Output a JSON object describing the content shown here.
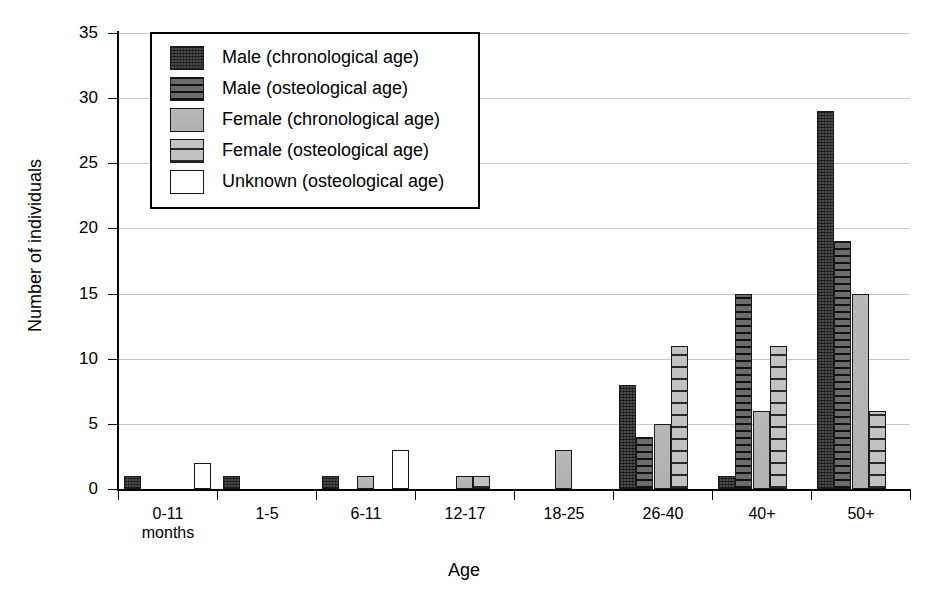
{
  "chart_data": {
    "type": "bar",
    "title": "",
    "xlabel": "Age",
    "ylabel": "Number of individuals",
    "ylim": [
      0,
      35
    ],
    "ytick_step": 5,
    "yticks": [
      0,
      5,
      10,
      15,
      20,
      25,
      30,
      35
    ],
    "grid": "horizontal",
    "legend_position": "upper-left-inside",
    "categories": [
      "0-11\nmonths",
      "1-5",
      "6-11",
      "12-17",
      "18-25",
      "26-40",
      "40+",
      "50+"
    ],
    "category_labels": [
      {
        "line1": "0-11",
        "line2": "months"
      },
      {
        "line1": "1-5",
        "line2": ""
      },
      {
        "line1": "6-11",
        "line2": ""
      },
      {
        "line1": "12-17",
        "line2": ""
      },
      {
        "line1": "18-25",
        "line2": ""
      },
      {
        "line1": "26-40",
        "line2": ""
      },
      {
        "line1": "40+",
        "line2": ""
      },
      {
        "line1": "50+",
        "line2": ""
      }
    ],
    "series": [
      {
        "name": "Male (chronological age)",
        "key": "male-chron",
        "pattern": "dark-crosshatch",
        "color": "#4a4a4a",
        "values": [
          1,
          1,
          1,
          0,
          0,
          8,
          1,
          29
        ]
      },
      {
        "name": "Male (osteological age)",
        "key": "male-osteo",
        "pattern": "dark-horizontal-lines",
        "color": "#3d3d3d",
        "values": [
          0,
          0,
          0,
          0,
          0,
          4,
          15,
          19
        ]
      },
      {
        "name": "Female (chronological age)",
        "key": "female-chron",
        "pattern": "solid-gray",
        "color": "#b3b3b3",
        "values": [
          0,
          0,
          1,
          1,
          3,
          5,
          6,
          15
        ]
      },
      {
        "name": "Female (osteological age)",
        "key": "female-osteo",
        "pattern": "gray-horizontal-lines",
        "color": "#b0b0b0",
        "values": [
          0,
          0,
          0,
          1,
          0,
          11,
          11,
          6
        ]
      },
      {
        "name": "Unknown (osteological age)",
        "key": "unknown-osteo",
        "pattern": "white-outline",
        "color": "#ffffff",
        "values": [
          2,
          0,
          3,
          0,
          0,
          0,
          0,
          0
        ]
      }
    ]
  },
  "legend": {
    "items": [
      {
        "label": "Male (chronological age)"
      },
      {
        "label": "Male (osteological age)"
      },
      {
        "label": "Female (chronological age)"
      },
      {
        "label": "Female (osteological age)"
      },
      {
        "label": "Unknown (osteological age)"
      }
    ]
  }
}
